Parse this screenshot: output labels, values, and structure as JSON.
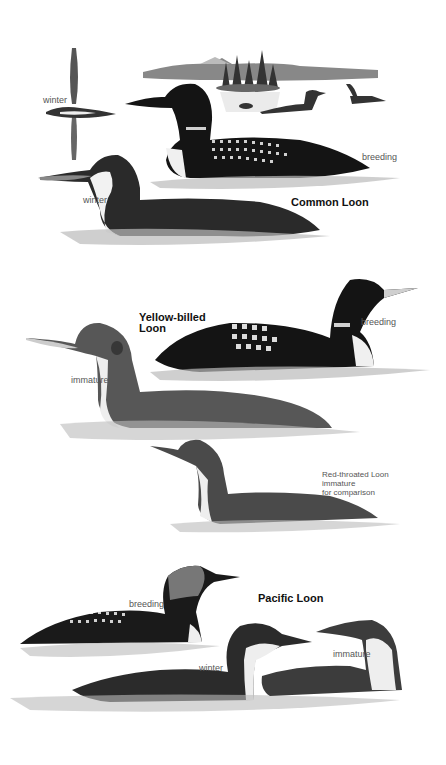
{
  "plate": {
    "sections": [
      {
        "species": "Common Loon",
        "labels": [
          "winter",
          "winter",
          "breeding"
        ]
      },
      {
        "species": "Yellow-billed Loon",
        "species_lines": [
          "Yellow-billed",
          "Loon"
        ],
        "labels": [
          "breeding",
          "immature"
        ],
        "comparison_note": [
          "Red-throated Loon",
          "immature",
          "for comparison"
        ]
      },
      {
        "species": "Pacific Loon",
        "labels": [
          "breeding",
          "winter",
          "immature"
        ]
      }
    ]
  },
  "colors": {
    "background": "#ffffff",
    "ink_dark": "#111111",
    "ink_mid": "#555555",
    "water": "#c8c8c8"
  }
}
